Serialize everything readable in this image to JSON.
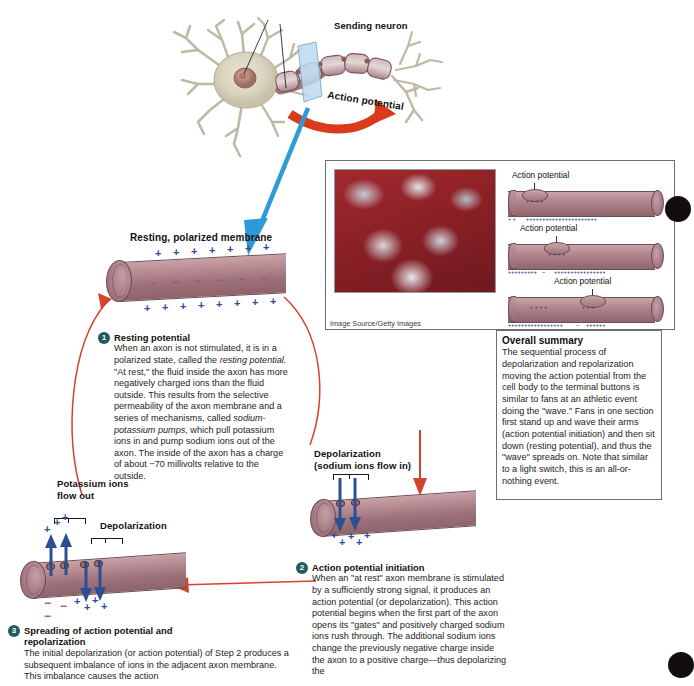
{
  "figure": {
    "top_labels": {
      "sending_neuron": "Sending neuron",
      "action_potential_arrow": "Action potential"
    },
    "membrane_labels": {
      "resting_polarized": "Resting, polarized membrane",
      "depolarization_sodium": "Depolarization\n(sodium ions flow in)",
      "depolarization_sodium_line1": "Depolarization",
      "depolarization_sodium_line2": "(sodium ions flow in)",
      "potassium_flow_line1": "Potassium ions",
      "potassium_flow_line2": "flow out",
      "depolarization": "Depolarization"
    },
    "steps": [
      {
        "number": "1",
        "title": "Resting potential",
        "body_part1": "When an axon is not stimulated, it is in a polarized state, called the ",
        "body_italic1": "resting potential.",
        "body_part2": " \"At rest,\" the fluid inside the axon has more negatively charged ions than the fluid outside. This results from the selective permeability of the axon membrane and a series of mechanisms, called ",
        "body_italic2": "sodium-potassium pumps,",
        "body_part3": " which pull potassium ions in and pump sodium ions out of the axon. The inside of the axon has a charge of about −70 millivolts relative to the outside."
      },
      {
        "number": "2",
        "title": "Action potential initiation",
        "body": "When an \"at rest\" axon membrane is stimulated by a sufficiently strong signal, it produces an action potential (or depolarization). This action potential begins when the first part of the axon opens its \"gates\" and positively charged sodium ions rush through. The additional sodium ions change the previously negative charge inside the axon to a positive charge—thus depolarizing the"
      },
      {
        "number": "3",
        "title_line1": "Spreading of action potential and",
        "title_line2": "repolarization",
        "body": "The initial depolarization (or action potential) of Step 2 produces a subsequent imbalance of ions in the adjacent axon membrane. This imbalance causes the action"
      }
    ],
    "inset": {
      "photo_credit": "Image Source/Getty Images",
      "diagrams": [
        {
          "label": "Action potential"
        },
        {
          "label": "Action potential"
        },
        {
          "label": "Action potential"
        }
      ]
    },
    "summary": {
      "title": "Overall summary",
      "body": "The sequential process of depolarization and repolarization moving the action potential from the cell body to the terminal buttons is similar to fans at an athletic event doing the \"wave.\" Fans in one section first stand up and wave their arms (action potential initiation) and then sit down (resting potential), and thus the \"wave\" spreads on. Note that similar to a light switch, this is an all-or-nothing event."
    },
    "colors": {
      "axon": "#a8808a",
      "axon_dark": "#6e4b55",
      "red_arrow": "#d93b1c",
      "cycle_arrow": "#d4442a",
      "blue_pointer": "#2e9bd8",
      "badge": "#1d5c63",
      "plus_ion": "#2f4b96",
      "minus_ion": "#b2555f",
      "soma": "#ded8c4",
      "nucleus": "#b98b7e"
    }
  }
}
